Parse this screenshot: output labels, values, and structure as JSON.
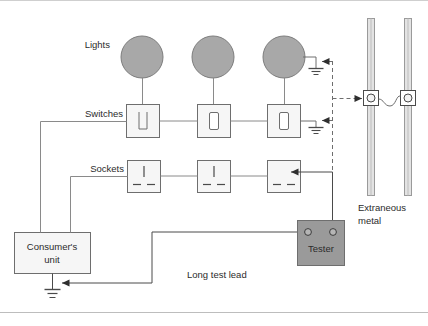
{
  "diagram": {
    "canvas": {
      "width": 428,
      "height": 326,
      "background": "#ffffff"
    },
    "colors": {
      "line": "#6e6e6e",
      "line_dark": "#3b3b3b",
      "fill_light": "#f4f4f4",
      "fill_lamp": "#a8a8a8",
      "fill_tester": "#9a9a9a",
      "pipe": "#d8d8d8",
      "text": "#2b2b2b",
      "frame": "#c9c9c9"
    },
    "labels": {
      "lights": "Lights",
      "switches": "Switches",
      "sockets": "Sockets",
      "consumer_unit_line1": "Consumer's",
      "consumer_unit_line2": "unit",
      "tester": "Tester",
      "extraneous_metal_line1": "Extraneous",
      "extraneous_metal_line2": "metal",
      "long_test_lead": "Long test lead"
    },
    "lights": [
      {
        "name": "light-1",
        "cx": 142,
        "cy": 57,
        "r": 21
      },
      {
        "name": "light-2",
        "cx": 213,
        "cy": 57,
        "r": 21
      },
      {
        "name": "light-3",
        "cx": 284,
        "cy": 57,
        "r": 21
      }
    ],
    "switches": [
      {
        "name": "switch-1",
        "x": 126,
        "y": 104,
        "w": 33,
        "h": 33
      },
      {
        "name": "switch-2",
        "x": 197,
        "y": 104,
        "w": 33,
        "h": 33
      },
      {
        "name": "switch-3",
        "x": 267,
        "y": 104,
        "w": 33,
        "h": 33
      }
    ],
    "sockets": [
      {
        "name": "socket-1",
        "x": 127,
        "y": 160,
        "w": 33,
        "h": 32
      },
      {
        "name": "socket-2",
        "x": 197,
        "y": 160,
        "w": 33,
        "h": 32
      },
      {
        "name": "socket-3",
        "x": 267,
        "y": 160,
        "w": 33,
        "h": 32
      }
    ],
    "consumer_unit": {
      "x": 14,
      "y": 232,
      "w": 76,
      "h": 41
    },
    "tester": {
      "x": 297,
      "y": 220,
      "w": 47,
      "h": 45,
      "terminal_left": {
        "cx": 308,
        "cy": 232,
        "r": 3.2
      },
      "terminal_right": {
        "cx": 333,
        "cy": 232,
        "r": 3.2
      }
    },
    "pipes": [
      {
        "name": "pipe-left",
        "x": 368,
        "y_top": 18,
        "y_bottom": 196,
        "w": 7
      },
      {
        "name": "pipe-right",
        "x": 405,
        "y_top": 18,
        "y_bottom": 196,
        "w": 7
      }
    ],
    "clamps": [
      {
        "name": "clamp-left",
        "cx": 371,
        "cy": 98,
        "size": 15
      },
      {
        "name": "clamp-right",
        "cx": 408,
        "cy": 98,
        "size": 15
      }
    ],
    "earth_symbols": [
      {
        "name": "earth-light-3",
        "x": 316,
        "y": 68
      },
      {
        "name": "earth-switch-3",
        "x": 316,
        "y": 127
      },
      {
        "name": "earth-consumer-unit",
        "x": 52,
        "y": 289
      }
    ],
    "test_probe_arrows": [
      {
        "name": "probe-arrow-light-earth",
        "x": 320,
        "y": 65
      },
      {
        "name": "probe-arrow-switch-earth",
        "x": 320,
        "y": 124
      },
      {
        "name": "probe-arrow-socket-3",
        "x": 284,
        "y": 170
      },
      {
        "name": "probe-arrow-clamp-left",
        "x": 356,
        "y": 98
      },
      {
        "name": "probe-arrow-consumer-earth",
        "x": 78,
        "y": 283
      }
    ]
  }
}
